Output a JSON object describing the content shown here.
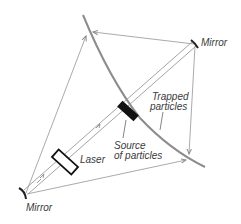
{
  "labels": {
    "mirror_top": "Mirror",
    "mirror_bottom": "Mirror",
    "trapped_line1": "Trapped",
    "trapped_line2": "particles",
    "source_line1": "Source",
    "source_line2": "of particles",
    "laser": "Laser"
  },
  "colors": {
    "beam": "#9a9a9a",
    "arc": "#8c8c8c",
    "source_block": "#111111",
    "laser_outline": "#111111",
    "mirror": "#222222",
    "text": "#3a3a3a"
  }
}
